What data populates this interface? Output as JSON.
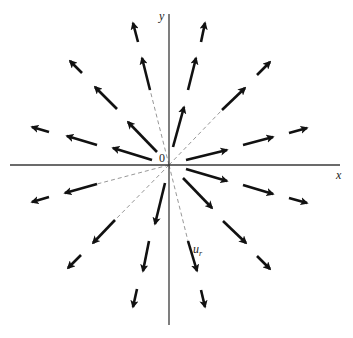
{
  "figure": {
    "axes": {
      "x_label": "x",
      "y_label": "y",
      "origin_label": "0",
      "origin": [
        169,
        165
      ],
      "x_axis": [
        10,
        340
      ],
      "y_axis": [
        14,
        325
      ]
    },
    "vector_label": {
      "base": "u",
      "subscript": "r",
      "position": [
        193,
        253
      ]
    },
    "colors": {
      "arrow": "#111111",
      "axis": "#3a3a3a",
      "dashed": "#6a6a6a",
      "background": "#ffffff"
    },
    "dashed_rays": [
      {
        "from": [
          169,
          165
        ],
        "to": [
          142,
          58
        ]
      },
      {
        "from": [
          169,
          165
        ],
        "to": [
          222,
          110
        ]
      },
      {
        "from": [
          169,
          165
        ],
        "to": [
          97,
          184
        ]
      },
      {
        "from": [
          169,
          165
        ],
        "to": [
          115,
          220
        ]
      },
      {
        "from": [
          169,
          165
        ],
        "to": [
          188,
          241
        ]
      }
    ],
    "arrows": [
      {
        "ray": "15deg",
        "from": [
          186,
          160
        ],
        "to": [
          227,
          150
        ]
      },
      {
        "ray": "15deg",
        "from": [
          243,
          145
        ],
        "to": [
          273,
          137
        ]
      },
      {
        "ray": "15deg",
        "from": [
          289,
          133
        ],
        "to": [
          307,
          128
        ]
      },
      {
        "ray": "45deg",
        "from": [
          222,
          110
        ],
        "to": [
          245,
          88
        ]
      },
      {
        "ray": "45deg",
        "from": [
          257,
          75
        ],
        "to": [
          270,
          62
        ]
      },
      {
        "ray": "75deg",
        "from": [
          173,
          147
        ],
        "to": [
          184,
          107
        ]
      },
      {
        "ray": "75deg",
        "from": [
          188,
          90
        ],
        "to": [
          196,
          58
        ]
      },
      {
        "ray": "75deg",
        "from": [
          201,
          42
        ],
        "to": [
          205,
          23
        ]
      },
      {
        "ray": "105deg",
        "from": [
          150,
          90
        ],
        "to": [
          142,
          58
        ]
      },
      {
        "ray": "105deg",
        "from": [
          138,
          42
        ],
        "to": [
          133,
          23
        ]
      },
      {
        "ray": "135deg",
        "from": [
          157,
          152
        ],
        "to": [
          128,
          122
        ]
      },
      {
        "ray": "135deg",
        "from": [
          117,
          109
        ],
        "to": [
          95,
          87
        ]
      },
      {
        "ray": "135deg",
        "from": [
          82,
          73
        ],
        "to": [
          70,
          61
        ]
      },
      {
        "ray": "165deg",
        "from": [
          152,
          160
        ],
        "to": [
          113,
          148
        ]
      },
      {
        "ray": "165deg",
        "from": [
          97,
          145
        ],
        "to": [
          67,
          136
        ]
      },
      {
        "ray": "165deg",
        "from": [
          49,
          132
        ],
        "to": [
          32,
          127
        ]
      },
      {
        "ray": "195deg",
        "from": [
          97,
          184
        ],
        "to": [
          65,
          193
        ]
      },
      {
        "ray": "195deg",
        "from": [
          49,
          197
        ],
        "to": [
          32,
          202
        ]
      },
      {
        "ray": "225deg",
        "from": [
          115,
          220
        ],
        "to": [
          93,
          243
        ]
      },
      {
        "ray": "225deg",
        "from": [
          81,
          255
        ],
        "to": [
          68,
          268
        ]
      },
      {
        "ray": "255deg",
        "from": [
          165,
          183
        ],
        "to": [
          155,
          224
        ]
      },
      {
        "ray": "255deg",
        "from": [
          149,
          241
        ],
        "to": [
          143,
          271
        ]
      },
      {
        "ray": "255deg",
        "from": [
          137,
          289
        ],
        "to": [
          133,
          307
        ]
      },
      {
        "ray": "285deg",
        "from": [
          188,
          241
        ],
        "to": [
          197,
          271
        ]
      },
      {
        "ray": "285deg",
        "from": [
          201,
          290
        ],
        "to": [
          205,
          307
        ]
      },
      {
        "ray": "315deg",
        "from": [
          183,
          178
        ],
        "to": [
          212,
          208
        ]
      },
      {
        "ray": "315deg",
        "from": [
          223,
          221
        ],
        "to": [
          246,
          243
        ]
      },
      {
        "ray": "315deg",
        "from": [
          257,
          256
        ],
        "to": [
          270,
          269
        ]
      },
      {
        "ray": "345deg",
        "from": [
          186,
          169
        ],
        "to": [
          227,
          181
        ]
      },
      {
        "ray": "345deg",
        "from": [
          243,
          185
        ],
        "to": [
          273,
          194
        ]
      },
      {
        "ray": "345deg",
        "from": [
          289,
          198
        ],
        "to": [
          307,
          203
        ]
      }
    ]
  }
}
